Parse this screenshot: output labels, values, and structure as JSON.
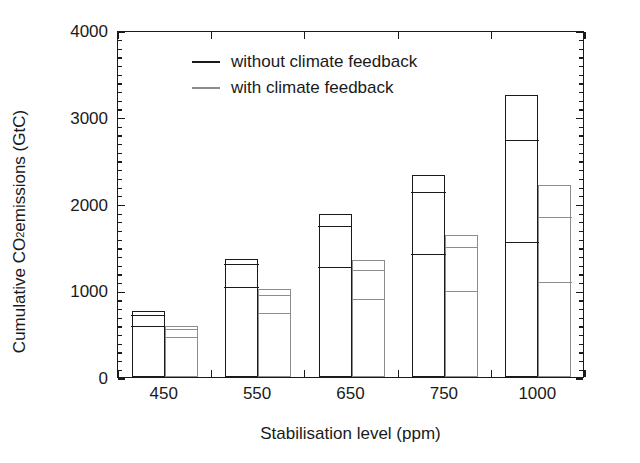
{
  "chart_data": {
    "type": "bar",
    "title": "",
    "xlabel": "Stabilisation level (ppm)",
    "ylabel": "Cumulative CO2 emissions (GtC)",
    "ylabel_prefix": "Cumulative CO",
    "ylabel_sub": "2",
    "ylabel_suffix": " emissions (GtC)",
    "categories": [
      "450",
      "550",
      "650",
      "750",
      "1000"
    ],
    "ylim": [
      0,
      4000
    ],
    "yticks": [
      0,
      1000,
      2000,
      3000,
      4000
    ],
    "ytick_labels": [
      "0",
      "1000",
      "2000",
      "3000",
      "4000"
    ],
    "yminor_step": 100,
    "grid": false,
    "legend_position": "upper-left-inside",
    "stacked": true,
    "series": [
      {
        "name": "without climate feedback",
        "color": "#1a1a1a",
        "segment_tops": [
          [
            560,
            690,
            760
          ],
          [
            1020,
            1280,
            1360
          ],
          [
            1250,
            1720,
            1880
          ],
          [
            1390,
            2110,
            2330
          ],
          [
            1530,
            2710,
            3250
          ]
        ],
        "totals": [
          760,
          1360,
          1880,
          2330,
          3250
        ]
      },
      {
        "name": "with climate feedback",
        "color": "#8c8c8c",
        "segment_tops": [
          [
            440,
            530,
            590
          ],
          [
            710,
            920,
            1020
          ],
          [
            880,
            1210,
            1350
          ],
          [
            970,
            1480,
            1640
          ],
          [
            1070,
            1820,
            2210
          ]
        ],
        "totals": [
          590,
          1020,
          1350,
          1640,
          2210
        ]
      }
    ]
  },
  "legend": {
    "items": [
      {
        "label": "without climate feedback",
        "color": "#1a1a1a"
      },
      {
        "label": "with climate feedback",
        "color": "#8c8c8c"
      }
    ]
  }
}
